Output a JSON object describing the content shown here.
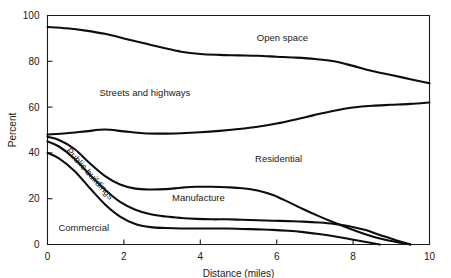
{
  "chart_data": {
    "type": "area",
    "title": "",
    "xlabel": "Distance (miles)",
    "ylabel": "Percent",
    "xlim": [
      0,
      10
    ],
    "ylim": [
      0,
      100
    ],
    "xticks": [
      0,
      2,
      4,
      6,
      8,
      10
    ],
    "yticks": [
      0,
      20,
      40,
      60,
      80,
      100
    ],
    "grid": false,
    "legend": "in-plot-labels",
    "band_labels": [
      {
        "name": "open-space",
        "text": "Open space",
        "x": 6.15,
        "y": 89
      },
      {
        "name": "streets-and-highways",
        "text": "Streets and highways",
        "x": 2.55,
        "y": 65
      },
      {
        "name": "residential",
        "text": "Residential",
        "x": 6.05,
        "y": 36
      },
      {
        "name": "manufacture",
        "text": "Manufacture",
        "x": 3.95,
        "y": 19
      },
      {
        "name": "commercial",
        "text": "Commercial",
        "x": 0.95,
        "y": 6
      },
      {
        "name": "public-buildings",
        "text": "Public buildings",
        "x": 1.05,
        "y": 30,
        "rotated": true
      }
    ],
    "boundaries": [
      {
        "name": "open-space-lower-boundary",
        "comment": "top of Streets and highways band",
        "x": [
          0,
          0.5,
          1.0,
          1.5,
          2.0,
          2.5,
          3.0,
          3.5,
          4.0,
          4.5,
          5.0,
          5.5,
          6.0,
          6.5,
          7.0,
          7.5,
          8.0,
          8.5,
          9.0,
          9.5,
          10.0
        ],
        "y": [
          95,
          94.4,
          93.4,
          92.0,
          90.0,
          88.0,
          86.0,
          84.2,
          83.2,
          82.8,
          82.6,
          82.4,
          82.0,
          81.6,
          81.0,
          80.0,
          78.0,
          75.8,
          74.0,
          72.2,
          70.4
        ]
      },
      {
        "name": "streets-and-highways-lower-boundary",
        "comment": "top of Residential band",
        "x": [
          0,
          0.5,
          1.0,
          1.5,
          2.0,
          2.5,
          3.0,
          3.5,
          4.0,
          4.5,
          5.0,
          5.5,
          6.0,
          6.5,
          7.0,
          7.5,
          8.0,
          8.5,
          9.0,
          9.5,
          10.0
        ],
        "y": [
          48.0,
          48.6,
          49.4,
          50.2,
          49.4,
          48.6,
          48.4,
          48.6,
          49.0,
          49.6,
          50.4,
          51.4,
          52.8,
          54.6,
          56.6,
          58.4,
          59.8,
          60.6,
          61.0,
          61.4,
          62.0
        ]
      },
      {
        "name": "residential-lower-boundary",
        "comment": "top of Manufacture band",
        "x": [
          0,
          0.3,
          0.7,
          1.1,
          1.5,
          1.9,
          2.3,
          2.7,
          3.1,
          3.5,
          3.9,
          4.3,
          4.7,
          5.1,
          5.5,
          5.9,
          6.3,
          6.7,
          7.1,
          7.5,
          7.9,
          8.3,
          8.7,
          9.1,
          9.5
        ],
        "y": [
          47.0,
          45.6,
          41.8,
          35.6,
          30.0,
          26.2,
          24.4,
          24.0,
          24.2,
          24.8,
          25.2,
          25.2,
          25.0,
          24.6,
          23.6,
          21.6,
          18.6,
          15.4,
          12.4,
          9.6,
          7.0,
          4.6,
          2.6,
          1.2,
          0.0
        ]
      },
      {
        "name": "manufacture-lower-boundary",
        "comment": "top of Public buildings band",
        "x": [
          0,
          0.3,
          0.7,
          1.1,
          1.5,
          1.9,
          2.3,
          2.7,
          3.1,
          3.5,
          3.9,
          4.3,
          4.7,
          5.1,
          5.5,
          5.9,
          6.3,
          6.7,
          7.1,
          7.5,
          7.9,
          8.3,
          8.7,
          9.1,
          9.5
        ],
        "y": [
          45.0,
          42.8,
          37.6,
          30.6,
          24.0,
          18.6,
          15.2,
          13.2,
          12.2,
          11.6,
          11.2,
          11.0,
          11.0,
          10.8,
          10.6,
          10.4,
          10.2,
          10.0,
          9.6,
          9.0,
          8.0,
          6.4,
          4.2,
          2.0,
          0.0
        ]
      },
      {
        "name": "public-buildings-lower-boundary",
        "comment": "top of Commercial band",
        "x": [
          0,
          0.3,
          0.7,
          1.1,
          1.5,
          1.9,
          2.3,
          2.7,
          3.1,
          3.5,
          3.9,
          4.3,
          4.7,
          5.1,
          5.5,
          5.9,
          6.3,
          6.7,
          7.1,
          7.5,
          7.9,
          8.3,
          8.7
        ],
        "y": [
          40.0,
          37.6,
          32.2,
          24.8,
          17.6,
          12.2,
          9.0,
          7.6,
          7.2,
          7.0,
          7.0,
          7.0,
          7.0,
          6.8,
          6.6,
          6.4,
          6.0,
          5.4,
          4.6,
          3.6,
          2.4,
          1.2,
          0.0
        ]
      }
    ]
  }
}
